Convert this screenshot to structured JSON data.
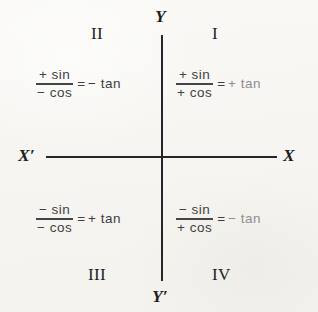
{
  "figure": {
    "background_color": "#f8f7f4",
    "axis_color": "#26262a"
  },
  "axes": {
    "y_top_label": "Y",
    "y_bottom_label": "Y′",
    "x_left_label": "X′",
    "x_right_label": "X"
  },
  "quadrants": [
    {
      "name": "quadrant-one",
      "label": "I",
      "numerator": "+ sin",
      "denominator": "+ cos",
      "equals": "=",
      "result": "+ tan",
      "result_color": "#8e8e93"
    },
    {
      "name": "quadrant-two",
      "label": "II",
      "numerator": "+ sin",
      "denominator": "− cos",
      "equals": "=",
      "result": "− tan",
      "result_color": "#3c3c42"
    },
    {
      "name": "quadrant-three",
      "label": "III",
      "numerator": "− sin",
      "denominator": "− cos",
      "equals": "=",
      "result": "+ tan",
      "result_color": "#3c3c42"
    },
    {
      "name": "quadrant-four",
      "label": "IV",
      "numerator": "− sin",
      "denominator": "+ cos",
      "equals": "=",
      "result": "− tan",
      "result_color": "#8e8e93"
    }
  ]
}
